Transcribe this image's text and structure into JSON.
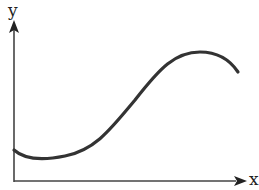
{
  "diagram": {
    "x_label": "x",
    "y_label": "y",
    "curve_color": "#333333",
    "axis_color": "#444444",
    "curve_path": "M 14 150 C 25 160, 45 160, 65 156 C 95 150, 110 130, 135 100 C 160 68, 175 52, 200 52 C 218 52, 230 60, 238 72",
    "curve_description": "smooth S-shaped curve: starts near origin, dips to a minimum, rises through an inflection, peaks, then falls"
  }
}
